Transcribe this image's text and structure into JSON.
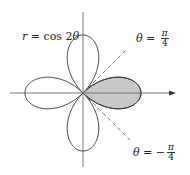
{
  "diagram": {
    "type": "polar-rose",
    "equation_label": {
      "var": "r",
      "eq": " = cos 2",
      "theta": "θ"
    },
    "line_labels": [
      {
        "name": "theta-pi-over-4",
        "theta": "θ",
        "eq": " = ",
        "sign": "",
        "num": "π",
        "den": "4"
      },
      {
        "name": "theta-minus-pi-over-4",
        "theta": "θ",
        "eq": " = ",
        "sign": "−",
        "num": "π",
        "den": "4"
      }
    ],
    "shaded_region": "right petal between θ = −π/4 and θ = π/4",
    "colors": {
      "curve": "#333333",
      "shade": "#c8c8c8",
      "axis": "#555555",
      "dash": "#666666"
    }
  }
}
